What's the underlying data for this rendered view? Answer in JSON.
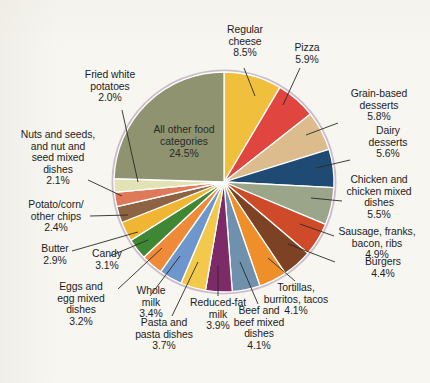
{
  "chart_data": {
    "type": "pie",
    "title": "",
    "subtitle": "",
    "xlabel": "",
    "ylabel": "",
    "legend_position": "none",
    "grid": false,
    "units": "percent",
    "total": 100.0,
    "center": {
      "x": 224,
      "y": 182,
      "radius": 110
    },
    "start_angle_deg": 0,
    "direction": "clockwise",
    "categories": [
      "Regular cheese",
      "Pizza",
      "Grain-based desserts",
      "Dairy desserts",
      "Chicken and chicken mixed dishes",
      "Sausage, franks, bacon, ribs",
      "Burgers",
      "Tortillas, burritos, tacos",
      "Beef and beef mixed dishes",
      "Reduced-fat milk",
      "Pasta and pasta dishes",
      "Whole milk",
      "Eggs and egg mixed dishes",
      "Candy",
      "Butter",
      "Potato/corn/other chips",
      "Nuts and seeds, and nut and seed mixed dishes",
      "Fried white potatoes",
      "All other food categories"
    ],
    "values": [
      8.5,
      5.9,
      5.8,
      5.6,
      5.5,
      4.9,
      4.4,
      4.1,
      4.1,
      3.9,
      3.7,
      3.4,
      3.2,
      3.1,
      2.9,
      2.4,
      2.1,
      2.0,
      24.5
    ],
    "colors": [
      "#f0c03c",
      "#e0453f",
      "#dcbc8d",
      "#1e4a73",
      "#9aa58a",
      "#cf4a28",
      "#7d4223",
      "#ef8f2a",
      "#6f91ad",
      "#7c2b68",
      "#f2c94a",
      "#6d96cc",
      "#ef8b38",
      "#3f8734",
      "#f0b533",
      "#8d6343",
      "#de7a5a",
      "#e2e2b4",
      "#8f9370"
    ],
    "slices": [
      {
        "label": "Regular cheese",
        "value": 8.5,
        "display": "8.5%",
        "color": "#f0c03c"
      },
      {
        "label": "Pizza",
        "value": 5.9,
        "display": "5.9%",
        "color": "#e0453f"
      },
      {
        "label": "Grain-based desserts",
        "value": 5.8,
        "display": "5.8%",
        "color": "#dcbc8d"
      },
      {
        "label": "Dairy desserts",
        "value": 5.6,
        "display": "5.6%",
        "color": "#1e4a73"
      },
      {
        "label": "Chicken and chicken mixed dishes",
        "value": 5.5,
        "display": "5.5%",
        "color": "#9aa58a"
      },
      {
        "label": "Sausage, franks, bacon, ribs",
        "value": 4.9,
        "display": "4.9%",
        "color": "#cf4a28"
      },
      {
        "label": "Burgers",
        "value": 4.4,
        "display": "4.4%",
        "color": "#7d4223"
      },
      {
        "label": "Tortillas, burritos, tacos",
        "value": 4.1,
        "display": "4.1%",
        "color": "#ef8f2a"
      },
      {
        "label": "Beef and beef mixed dishes",
        "value": 4.1,
        "display": "4.1%",
        "color": "#6f91ad"
      },
      {
        "label": "Reduced-fat milk",
        "value": 3.9,
        "display": "3.9%",
        "color": "#7c2b68"
      },
      {
        "label": "Pasta and pasta dishes",
        "value": 3.7,
        "display": "3.7%",
        "color": "#f2c94a"
      },
      {
        "label": "Whole milk",
        "value": 3.4,
        "display": "3.4%",
        "color": "#6d96cc"
      },
      {
        "label": "Eggs and egg mixed dishes",
        "value": 3.2,
        "display": "3.2%",
        "color": "#ef8b38"
      },
      {
        "label": "Candy",
        "value": 3.1,
        "display": "3.1%",
        "color": "#3f8734"
      },
      {
        "label": "Butter",
        "value": 2.9,
        "display": "2.9%",
        "color": "#f0b533"
      },
      {
        "label": "Potato/corn/other chips",
        "value": 2.4,
        "display": "2.4%",
        "color": "#8d6343"
      },
      {
        "label": "Nuts and seeds, and nut and seed mixed dishes",
        "value": 2.1,
        "display": "2.1%",
        "color": "#de7a5a"
      },
      {
        "label": "Fried white potatoes",
        "value": 2.0,
        "display": "2.0%",
        "color": "#e2e2b4"
      },
      {
        "label": "All other food categories",
        "value": 24.5,
        "display": "24.5%",
        "color": "#8f9370"
      }
    ]
  },
  "inside_label": {
    "line1": "All other food",
    "line2": "categories",
    "line3": "24.5%"
  },
  "callouts": {
    "regular_cheese": "Regular\ncheese\n8.5%",
    "pizza": "Pizza\n5.9%",
    "grain_based_desserts": "Grain-based\ndesserts\n5.8%",
    "dairy_desserts": "Dairy\ndesserts\n5.6%",
    "chicken": "Chicken and\nchicken mixed\ndishes\n5.5%",
    "sausage": "Sausage, franks,\nbacon, ribs\n4.9%",
    "burgers": "Burgers\n4.4%",
    "tortillas": "Tortillas,\nburritos, tacos\n4.1%",
    "beef": "Beef and\nbeef mixed\ndishes\n4.1%",
    "reduced_fat_milk": "Reduced-fat\nmilk\n3.9%",
    "pasta": "Pasta and\npasta dishes\n3.7%",
    "whole_milk": "Whole\nmilk\n3.4%",
    "eggs": "Eggs and\negg mixed\ndishes\n3.2%",
    "candy": "Candy\n3.1%",
    "butter": "Butter\n2.9%",
    "chips": "Potato/corn/\nother chips\n2.4%",
    "nuts": "Nuts and seeds,\nand nut and\nseed mixed\ndishes\n2.1%",
    "fried_white_potatoes": "Fried white\npotatoes\n2.0%"
  },
  "style": {
    "background": "#f7f6f1",
    "rim_color": "#bfa9bf",
    "separator_color": "#ffffff",
    "leader_color": "#2a2a26",
    "text_color": "#1d1d1b"
  }
}
